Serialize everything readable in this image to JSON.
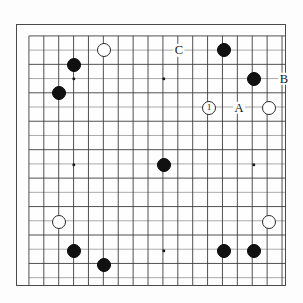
{
  "diagram": {
    "board_size": 19,
    "colors": {
      "black_stone": "#111111",
      "white_stone": "#ffffff",
      "stone_outline": "#2c2c2c",
      "grid_line": "#3c3c3c",
      "grid_line_light": "#9a9a9a",
      "board_border": "#4a4a4a",
      "board_background": "#fefefe",
      "page_background": "#ffffff",
      "label_text": "#141414"
    },
    "geometry": {
      "board_left": 16,
      "board_top": 24,
      "board_width": 270,
      "board_height": 262,
      "cell_width": 15,
      "cell_height": 14.33,
      "origin_x": 28,
      "origin_y": 35,
      "stone_diameter": 14,
      "hoshi_diameter": 3.4
    },
    "hoshi_points": [
      {
        "name": "hoshi-top-left",
        "col": 3,
        "row": 3
      },
      {
        "name": "hoshi-top-center",
        "col": 9,
        "row": 3
      },
      {
        "name": "hoshi-top-right",
        "col": 15,
        "row": 3
      },
      {
        "name": "hoshi-mid-left",
        "col": 3,
        "row": 9
      },
      {
        "name": "hoshi-center",
        "col": 9,
        "row": 9
      },
      {
        "name": "hoshi-mid-right",
        "col": 15,
        "row": 9
      },
      {
        "name": "hoshi-bottom-left",
        "col": 3,
        "row": 15
      },
      {
        "name": "hoshi-bottom-center",
        "col": 9,
        "row": 15
      },
      {
        "name": "hoshi-bottom-right",
        "col": 15,
        "row": 15
      }
    ],
    "stones": [
      {
        "id": "stone-white-top-left",
        "color": "white",
        "col": 5,
        "row": 1,
        "label": ""
      },
      {
        "id": "stone-black-upper-left-a",
        "color": "black",
        "col": 3,
        "row": 2,
        "label": ""
      },
      {
        "id": "stone-black-upper-left-b",
        "color": "black",
        "col": 2,
        "row": 4,
        "label": ""
      },
      {
        "id": "stone-black-top-right-a",
        "color": "black",
        "col": 13,
        "row": 1,
        "label": ""
      },
      {
        "id": "stone-black-top-right-b",
        "color": "black",
        "col": 15,
        "row": 3,
        "label": ""
      },
      {
        "id": "stone-white-move-1",
        "color": "white",
        "col": 12,
        "row": 5,
        "label": "1"
      },
      {
        "id": "stone-white-right-upper",
        "color": "white",
        "col": 16,
        "row": 5,
        "label": ""
      },
      {
        "id": "stone-black-center",
        "color": "black",
        "col": 9,
        "row": 9,
        "label": ""
      },
      {
        "id": "stone-white-lower-left",
        "color": "white",
        "col": 2,
        "row": 13,
        "label": ""
      },
      {
        "id": "stone-white-lower-right",
        "color": "white",
        "col": 16,
        "row": 13,
        "label": ""
      },
      {
        "id": "stone-black-bottom-left-a",
        "color": "black",
        "col": 3,
        "row": 15,
        "label": ""
      },
      {
        "id": "stone-black-bottom-left-b",
        "color": "black",
        "col": 5,
        "row": 16,
        "label": ""
      },
      {
        "id": "stone-black-bottom-right-a",
        "color": "black",
        "col": 13,
        "row": 15,
        "label": ""
      },
      {
        "id": "stone-black-bottom-right-b",
        "color": "black",
        "col": 15,
        "row": 15,
        "label": ""
      }
    ],
    "point_labels": [
      {
        "id": "label-c",
        "text": "C",
        "col": 10,
        "row": 1
      },
      {
        "id": "label-b",
        "text": "B",
        "col": 17,
        "row": 3
      },
      {
        "id": "label-a",
        "text": "A",
        "col": 14,
        "row": 5
      }
    ]
  },
  "chart_data": {
    "type": "table",
    "categories": [
      "black stones",
      "white stones",
      "labelled points"
    ],
    "values": [
      9,
      5,
      3
    ]
  }
}
